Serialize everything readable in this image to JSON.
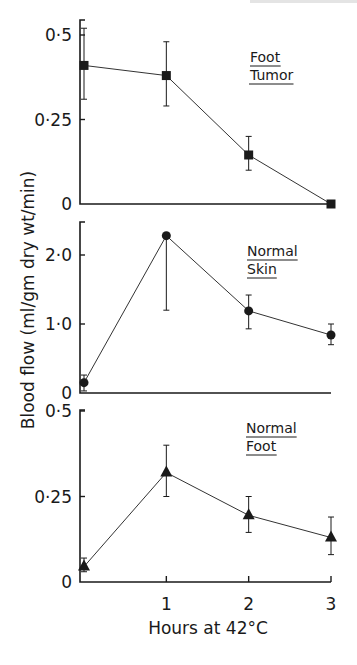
{
  "chart_data": {
    "type": "line",
    "title": "",
    "xlabel": "Hours at 42°C",
    "ylabel": "Blood flow (ml/gm dry wt/min)",
    "x": [
      0,
      1,
      2,
      3
    ],
    "x_tick_labels": [
      "1",
      "2",
      "3"
    ],
    "x_ticks": [
      1,
      2,
      3
    ],
    "xlim": [
      0,
      3
    ],
    "grid": false,
    "legend_position": "none",
    "panels": [
      {
        "label_line1": "Foot",
        "label_line2": "Tumor",
        "marker": "square",
        "ylim": [
          0,
          0.5
        ],
        "y_ticks": [
          0,
          0.25,
          0.5
        ],
        "y_tick_labels": [
          "0",
          "0·25",
          "0·5"
        ],
        "values": [
          0.41,
          0.38,
          0.145,
          0.0
        ],
        "error_low": [
          0.31,
          0.29,
          0.1,
          0.0
        ],
        "error_high": [
          0.52,
          0.48,
          0.2,
          0.0
        ]
      },
      {
        "label_line1": "Normal",
        "label_line2": "Skin",
        "marker": "circle",
        "ylim": [
          0,
          2.5
        ],
        "y_ticks": [
          0,
          1.0,
          2.0
        ],
        "y_tick_labels": [
          "0",
          "1·0",
          "2·0"
        ],
        "values": [
          0.15,
          2.28,
          1.19,
          0.84
        ],
        "error_low": [
          0.03,
          1.2,
          0.93,
          0.7
        ],
        "error_high": [
          0.26,
          2.28,
          1.42,
          1.0
        ]
      },
      {
        "label_line1": "Normal",
        "label_line2": "Foot",
        "marker": "triangle",
        "ylim": [
          0,
          0.5
        ],
        "y_ticks": [
          0,
          0.25,
          0.5
        ],
        "y_tick_labels": [
          "0",
          "0·25",
          "0·5"
        ],
        "values": [
          0.045,
          0.32,
          0.195,
          0.13
        ],
        "error_low": [
          0.03,
          0.25,
          0.145,
          0.08
        ],
        "error_high": [
          0.07,
          0.4,
          0.25,
          0.19
        ]
      }
    ]
  },
  "colors": {
    "ink": "#1a1a1a",
    "background": "#ffffff"
  }
}
